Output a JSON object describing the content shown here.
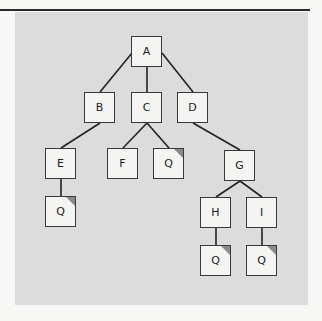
{
  "diagram": {
    "type": "tree",
    "colors": {
      "background": "#f7f7f5",
      "panel": "#dcdcdc",
      "node_fill": "#f4f4f2",
      "node_border": "#3a3a3a",
      "edge": "#222222",
      "corner_mark": "#8a8a8a",
      "rule": "#2a2a2a"
    },
    "nodes": [
      {
        "id": "A",
        "label": "A",
        "x": 131,
        "y": 36,
        "marked": false
      },
      {
        "id": "B",
        "label": "B",
        "x": 84,
        "y": 92,
        "marked": false
      },
      {
        "id": "C",
        "label": "C",
        "x": 131,
        "y": 92,
        "marked": false
      },
      {
        "id": "D",
        "label": "D",
        "x": 177,
        "y": 92,
        "marked": false
      },
      {
        "id": "E",
        "label": "E",
        "x": 45,
        "y": 148,
        "marked": false
      },
      {
        "id": "F",
        "label": "F",
        "x": 107,
        "y": 148,
        "marked": false
      },
      {
        "id": "Q1",
        "label": "Q",
        "x": 153,
        "y": 148,
        "marked": true
      },
      {
        "id": "G",
        "label": "G",
        "x": 224,
        "y": 150,
        "marked": false
      },
      {
        "id": "Q2",
        "label": "Q",
        "x": 45,
        "y": 196,
        "marked": true
      },
      {
        "id": "H",
        "label": "H",
        "x": 200,
        "y": 197,
        "marked": false
      },
      {
        "id": "I",
        "label": "I",
        "x": 246,
        "y": 197,
        "marked": false
      },
      {
        "id": "Q3",
        "label": "Q",
        "x": 200,
        "y": 245,
        "marked": true
      },
      {
        "id": "Q4",
        "label": "Q",
        "x": 246,
        "y": 245,
        "marked": true
      }
    ],
    "edges": [
      {
        "from": "A",
        "to": "B",
        "x1": 132,
        "y1": 53,
        "x2": 100,
        "y2": 92
      },
      {
        "from": "A",
        "to": "C",
        "x1": 147,
        "y1": 67,
        "x2": 147,
        "y2": 92
      },
      {
        "from": "A",
        "to": "D",
        "x1": 162,
        "y1": 53,
        "x2": 193,
        "y2": 92
      },
      {
        "from": "B",
        "to": "E",
        "x1": 100,
        "y1": 123,
        "x2": 61,
        "y2": 148
      },
      {
        "from": "C",
        "to": "F",
        "x1": 147,
        "y1": 123,
        "x2": 123,
        "y2": 148
      },
      {
        "from": "C",
        "to": "Q1",
        "x1": 147,
        "y1": 123,
        "x2": 169,
        "y2": 148
      },
      {
        "from": "D",
        "to": "G",
        "x1": 193,
        "y1": 123,
        "x2": 240,
        "y2": 150
      },
      {
        "from": "E",
        "to": "Q2",
        "x1": 61,
        "y1": 179,
        "x2": 61,
        "y2": 196
      },
      {
        "from": "G",
        "to": "H",
        "x1": 240,
        "y1": 181,
        "x2": 216,
        "y2": 197
      },
      {
        "from": "G",
        "to": "I",
        "x1": 240,
        "y1": 181,
        "x2": 262,
        "y2": 197
      },
      {
        "from": "H",
        "to": "Q3",
        "x1": 216,
        "y1": 228,
        "x2": 216,
        "y2": 245
      },
      {
        "from": "I",
        "to": "Q4",
        "x1": 262,
        "y1": 228,
        "x2": 262,
        "y2": 245
      }
    ]
  }
}
